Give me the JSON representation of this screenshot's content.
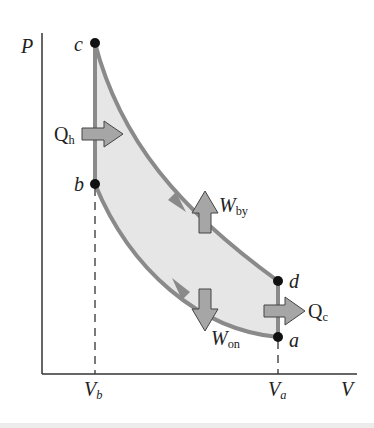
{
  "diagram": {
    "type": "pv-cycle",
    "axes": {
      "y_label": "P",
      "x_label": "V",
      "x_ticks": [
        {
          "label": "V",
          "sub": "b"
        },
        {
          "label": "V",
          "sub": "a"
        }
      ]
    },
    "points": [
      {
        "id": "a",
        "label": "a"
      },
      {
        "id": "b",
        "label": "b"
      },
      {
        "id": "c",
        "label": "c"
      },
      {
        "id": "d",
        "label": "d"
      }
    ],
    "flows": {
      "heat_in": {
        "label": "Q",
        "sub": "h"
      },
      "heat_out": {
        "label": "Q",
        "sub": "c"
      },
      "work_by": {
        "label": "W",
        "sub": "by"
      },
      "work_on": {
        "label": "W",
        "sub": "on"
      }
    },
    "colors": {
      "curve": "#8a8a8a",
      "fill": "#e6e6e6",
      "arrow_fill": "#a6a6a6",
      "arrow_stroke": "#444444",
      "point": "#111111",
      "axis": "#333333"
    }
  }
}
